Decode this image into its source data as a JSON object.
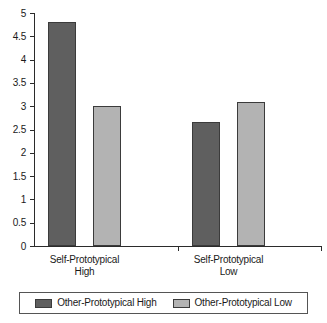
{
  "chart_data": {
    "type": "bar",
    "title": "",
    "xlabel": "",
    "ylabel": "",
    "ylim": [
      0,
      5
    ],
    "ytick_step": 0.5,
    "grid": false,
    "legend_position": "bottom",
    "categories": [
      "Self-Prototypical High",
      "Self-Prototypical Low"
    ],
    "category_lines": [
      [
        "Self-Prototypical",
        "High"
      ],
      [
        "Self-Prototypical",
        "Low"
      ]
    ],
    "yticks": [
      "0",
      "0.5",
      "1",
      "1.5",
      "2",
      "2.5",
      "3",
      "3.5",
      "4",
      "4.5",
      "5"
    ],
    "ytick_values": [
      0,
      0.5,
      1,
      1.5,
      2,
      2.5,
      3,
      3.5,
      4,
      4.5,
      5
    ],
    "series": [
      {
        "name": "Other-Prototypical High",
        "color": "#5f5f5f",
        "values": [
          4.8,
          2.67
        ]
      },
      {
        "name": "Other-Prototypical Low",
        "color": "#b3b3b3",
        "values": [
          3.0,
          3.1
        ]
      }
    ]
  },
  "legend": {
    "entries": [
      {
        "label": "Other-Prototypical High",
        "color": "#5f5f5f"
      },
      {
        "label": "Other-Prototypical Low",
        "color": "#b3b3b3"
      }
    ]
  }
}
